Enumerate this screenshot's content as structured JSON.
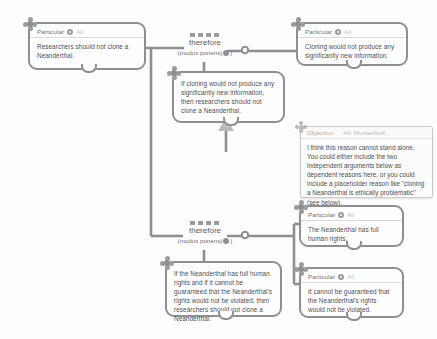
{
  "canvas": {
    "background": "#fdfdfd",
    "line_color": "#8d8f92",
    "text_color": "#4e5053"
  },
  "nodes": {
    "conclusion": {
      "kind": "Particular",
      "scope": "All",
      "text": "Researchers should not clone a Neanderthal."
    },
    "reason_top": {
      "kind": "Particular",
      "scope": "All",
      "text": "Cloning would not produce any significantly new information."
    },
    "conditional_top": {
      "text": "If cloning would not produce any significantly new information, then researchers should not clone a Neanderthal."
    },
    "conditional_bottom": {
      "text": "If the Neanderthal has full human rights and if it cannot be guaranteed that the Neanderthal's rights would not be violated, then researchers should not clone a Neanderthal."
    },
    "reason_rights": {
      "kind": "Particular",
      "scope": "All",
      "text": "The Neanderthal has full human rights."
    },
    "reason_guarantee": {
      "kind": "Particular",
      "scope": "All",
      "text": "It cannot be guaranteed that the Neanderthal's rights would not be violated."
    }
  },
  "inferences": {
    "top": {
      "label": "therefore",
      "rule": "(modus ponens)"
    },
    "bottom": {
      "label": "therefore",
      "rule": "(modus ponens)"
    }
  },
  "note": {
    "kind": "Objection",
    "author": "All: Michaelkoff...",
    "text": "I think this reason cannot stand alone. You could either include the two independent arguments below as dependent reasons here, or you could include a placeholder reason like \"cloning a Neanderthal is ethically problematic\" (see below)."
  }
}
